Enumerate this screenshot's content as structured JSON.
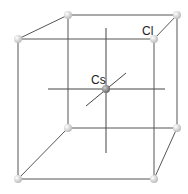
{
  "diagram": {
    "labels": {
      "corner_atom": "Cl",
      "center_atom": "Cs"
    },
    "colors": {
      "corner_atom": "#e6e6e6",
      "center_atom": "#8a8a8a",
      "edges": "#555555"
    }
  }
}
